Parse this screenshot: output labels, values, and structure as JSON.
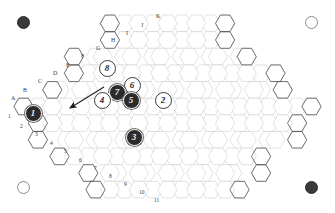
{
  "board": {
    "type": "hex-grid-rhombus",
    "shape_description": "diamond/rhombus tessellation of flat-top hexagons",
    "background_color": "#ffffff",
    "grid_line_color": "#c9c9c9",
    "border_line_color": "#555555",
    "rows": 17,
    "max_columns": 21
  },
  "corner_markers": [
    {
      "name": "top-left",
      "fill": "dark",
      "color": "#3a3a3a"
    },
    {
      "name": "top-right",
      "fill": "light",
      "color": "#ffffff"
    },
    {
      "name": "bottom-left",
      "fill": "light",
      "color": "#ffffff"
    },
    {
      "name": "bottom-right",
      "fill": "dark",
      "color": "#3a3a3a"
    }
  ],
  "letter_labels": [
    "A",
    "B",
    "C",
    "D",
    "E",
    "F",
    "G",
    "H",
    "I",
    "J",
    "K"
  ],
  "number_labels": [
    "1",
    "2",
    "3",
    "4",
    "5",
    "6",
    "7",
    "8",
    "9",
    "10",
    "11"
  ],
  "pieces": [
    {
      "label": "1",
      "fill": "dark",
      "x": 33,
      "y": 113
    },
    {
      "label": "8",
      "fill": "light",
      "x": 107,
      "y": 68
    },
    {
      "label": "6",
      "fill": "light",
      "x": 132,
      "y": 85
    },
    {
      "label": "7",
      "fill": "dark",
      "x": 117,
      "y": 92
    },
    {
      "label": "4",
      "fill": "light",
      "x": 102,
      "y": 100
    },
    {
      "label": "5",
      "fill": "dark",
      "x": 131,
      "y": 100
    },
    {
      "label": "2",
      "fill": "light",
      "x": 163,
      "y": 100
    },
    {
      "label": "3",
      "fill": "dark",
      "x": 134,
      "y": 137
    }
  ],
  "arrow": {
    "name": "direction-arrow",
    "from_x": 104,
    "from_y": 87,
    "to_x": 70,
    "to_y": 108,
    "color": "#1f1f1f"
  }
}
